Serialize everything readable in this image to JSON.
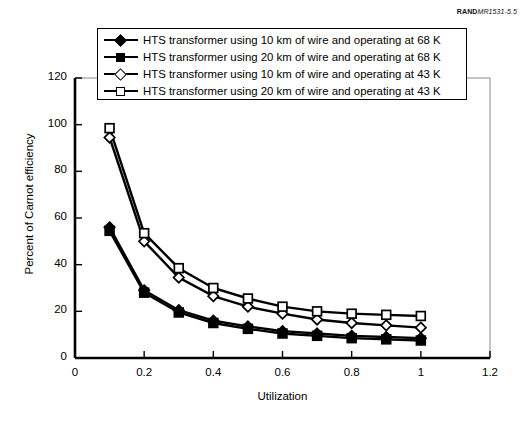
{
  "report_code": {
    "brand": "RAND",
    "document": "MR1531-5.5"
  },
  "chart_data": {
    "type": "line",
    "title": "",
    "subtitle": "",
    "xlabel": "Utilization",
    "ylabel": "Percent of Carnot efficiency",
    "xlim": [
      0,
      1.2
    ],
    "ylim": [
      0,
      120
    ],
    "xticks": [
      0,
      0.2,
      0.4,
      0.6,
      0.8,
      1,
      1.2
    ],
    "xtick_labels": [
      "0",
      "0.2",
      "0.4",
      "0.6",
      "0.8",
      "1",
      "1.2"
    ],
    "yticks": [
      0,
      20,
      40,
      60,
      80,
      100,
      120
    ],
    "ytick_labels": [
      "0",
      "20",
      "40",
      "60",
      "80",
      "100",
      "120"
    ],
    "grid": false,
    "legend_position": "top",
    "x": [
      0.1,
      0.2,
      0.3,
      0.4,
      0.5,
      0.6,
      0.7,
      0.8,
      0.9,
      1.0
    ],
    "series": [
      {
        "name": "HTS transformer using 10 km of wire and operating at 68 K",
        "marker": "filled-diamond",
        "values": [
          56,
          29,
          20.5,
          16,
          13.5,
          11.5,
          10.5,
          9.5,
          9,
          8.5
        ]
      },
      {
        "name": "HTS transformer using 20 km of wire and operating at 68 K",
        "marker": "filled-square",
        "values": [
          54.5,
          28,
          19.5,
          15,
          12.5,
          10.5,
          9.5,
          8.5,
          8,
          7.5
        ]
      },
      {
        "name": "HTS transformer using 10 km of wire and operating at 43 K",
        "marker": "open-diamond",
        "values": [
          94.5,
          50,
          34.5,
          26.5,
          22,
          19,
          16.5,
          15,
          14,
          13
        ]
      },
      {
        "name": "HTS transformer using 20 km of wire and operating at 43 K",
        "marker": "open-square",
        "values": [
          98.5,
          53.5,
          38.5,
          30,
          25.5,
          22,
          20,
          19,
          18.5,
          18
        ]
      }
    ]
  },
  "colors": {
    "line": "#000000",
    "background": "#ffffff",
    "axis": "#000000"
  }
}
